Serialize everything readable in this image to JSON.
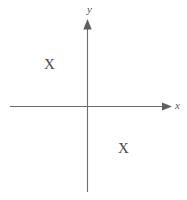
{
  "diagram": {
    "background_color": "#ffffff",
    "axis_color": "#6e6e6e",
    "label_color": "#555555",
    "mark_color": "#4a4a4a",
    "axes": {
      "x_axis": {
        "label": "x",
        "icon": "arrow-right-icon",
        "start_px": [
          10,
          106
        ],
        "end_px": [
          172,
          106
        ],
        "has_arrowhead": true
      },
      "y_axis": {
        "label": "y",
        "icon": "arrow-up-icon",
        "start_px": [
          87,
          192
        ],
        "end_px": [
          87,
          19
        ],
        "has_arrowhead": true
      },
      "origin_px": [
        87,
        106
      ]
    },
    "marks": [
      {
        "label": "X",
        "quadrant": "II",
        "position_px": [
          50,
          65
        ]
      },
      {
        "label": "X",
        "quadrant": "IV",
        "position_px": [
          124,
          149
        ]
      }
    ]
  }
}
